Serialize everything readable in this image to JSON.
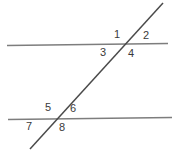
{
  "figure": {
    "type": "geometry-diagram",
    "canvas": {
      "width": 176,
      "height": 155
    },
    "background_color": "#ffffff",
    "line_color": "#7d7d7d",
    "transversal_color": "#4a4a4a",
    "label_color": "#3a3a3a",
    "lines": [
      {
        "name": "upper-parallel-line",
        "x1": 7,
        "y1": 45.5,
        "x2": 168,
        "y2": 43.5,
        "color": "#7d7d7d",
        "width": 1.6
      },
      {
        "name": "lower-parallel-line",
        "x1": 8,
        "y1": 119.5,
        "x2": 172,
        "y2": 117.5,
        "color": "#7d7d7d",
        "width": 1.6
      },
      {
        "name": "transversal-line",
        "x1": 30,
        "y1": 149,
        "x2": 163,
        "y2": 3,
        "color": "#4a4a4a",
        "width": 1.5
      }
    ],
    "intersections": [
      {
        "name": "upper-intersection",
        "x": 124,
        "y": 44.5
      },
      {
        "name": "lower-intersection",
        "x": 57,
        "y": 119
      }
    ],
    "labels": [
      {
        "name": "angle-label-1",
        "text": "1",
        "x": 114,
        "y": 29,
        "position": "upper-left-of-upper-intersection"
      },
      {
        "name": "angle-label-2",
        "text": "2",
        "x": 143,
        "y": 30,
        "position": "upper-right-of-upper-intersection"
      },
      {
        "name": "angle-label-3",
        "text": "3",
        "x": 100,
        "y": 47,
        "position": "lower-left-of-upper-intersection"
      },
      {
        "name": "angle-label-4",
        "text": "4",
        "x": 128,
        "y": 48,
        "position": "lower-right-of-upper-intersection"
      },
      {
        "name": "angle-label-5",
        "text": "5",
        "x": 45,
        "y": 102,
        "position": "upper-left-of-lower-intersection"
      },
      {
        "name": "angle-label-6",
        "text": "6",
        "x": 70,
        "y": 103,
        "position": "upper-right-of-lower-intersection"
      },
      {
        "name": "angle-label-7",
        "text": "7",
        "x": 26,
        "y": 121,
        "position": "lower-left-of-lower-intersection"
      },
      {
        "name": "angle-label-8",
        "text": "8",
        "x": 59,
        "y": 122,
        "position": "lower-right-of-lower-intersection"
      }
    ]
  }
}
